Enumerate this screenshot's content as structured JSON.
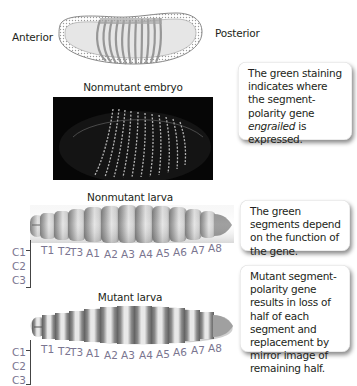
{
  "figure": {
    "orientation": {
      "anterior": "Anterior",
      "posterior": "Posterior"
    },
    "schematic_embryo": {
      "stripe_count": 14,
      "stripe_color": "#8a8a8a"
    },
    "nonmutant_embryo": {
      "title": "Nonmutant embryo",
      "stain_color": "#cfcfcf",
      "stripe_count": 14
    },
    "nonmutant_larva": {
      "title": "Nonmutant larva"
    },
    "mutant_larva": {
      "title": "Mutant larva"
    },
    "segment_labels": [
      "T1",
      "T2",
      "T3",
      "A1",
      "A2",
      "A3",
      "A4",
      "A5",
      "A6",
      "A7",
      "A8"
    ],
    "head_labels": [
      "C1",
      "C2",
      "C3"
    ],
    "label_color": "#7a7590"
  },
  "callouts": [
    {
      "id": "staining",
      "pre": "The green staining indicates where the segment-polarity gene ",
      "italic": "engrailed",
      "post": " is expressed."
    },
    {
      "id": "segments",
      "text": "The green segments depend on the function of the gene."
    },
    {
      "id": "mutant",
      "text": "Mutant segment-polarity gene results in loss of half of each segment and replacement by mirror image of remaining half."
    }
  ]
}
